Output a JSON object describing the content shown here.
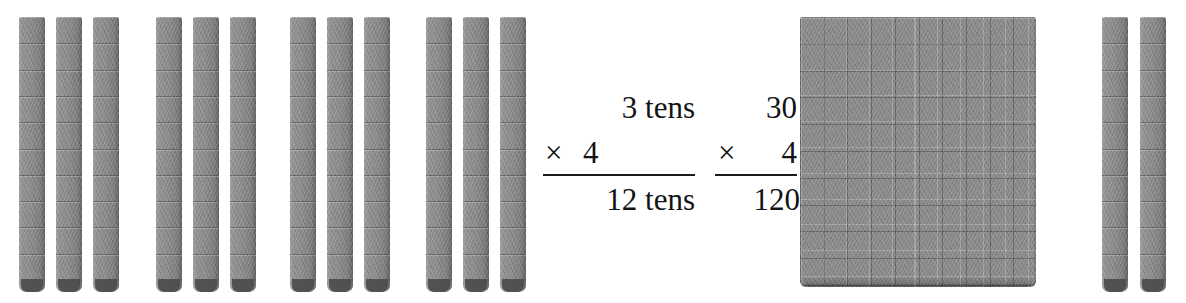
{
  "colors": {
    "background": "#ffffff",
    "block_gray": "#8b8b8b",
    "block_shadow": "#4c4c4c",
    "ink": "#141414"
  },
  "equations": [
    {
      "name": "tens-form",
      "multiplicand": "3 tens",
      "operator": "×",
      "multiplier": "4",
      "product": "12 tens"
    },
    {
      "name": "standard-form",
      "multiplicand": "30",
      "operator": "×",
      "multiplier": "4",
      "product": "120"
    }
  ],
  "manipulatives": {
    "left_groups": {
      "label": "four groups of three tens",
      "group_count": 4,
      "rods_per_group": 3,
      "segments_per_rod": 10,
      "value_per_rod": 10,
      "total_rods": 12,
      "total_value": 120
    },
    "right_result": {
      "label": "one flat and two tens",
      "flats": 1,
      "flat_rows": 10,
      "flat_columns": 10,
      "value_per_flat": 100,
      "loose_rods": 2,
      "segments_per_rod": 10,
      "value_per_rod": 10,
      "total_value": 120
    }
  }
}
